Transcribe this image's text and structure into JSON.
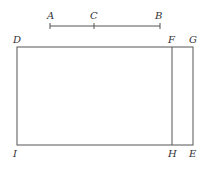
{
  "diagram": {
    "segment": {
      "labels": {
        "a": "A",
        "c": "C",
        "b": "B"
      }
    },
    "rectangle": {
      "labels": {
        "d": "D",
        "f": "F",
        "g": "G",
        "i": "I",
        "h": "H",
        "e": "E"
      }
    },
    "colors": {
      "line": "#555555",
      "text": "#333333",
      "background": "#ffffff"
    }
  }
}
